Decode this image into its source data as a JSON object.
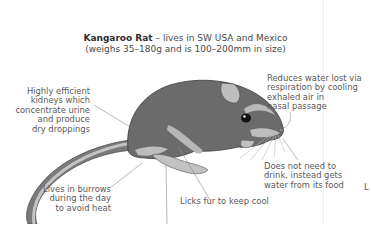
{
  "title": {
    "species": "Kangaroo Rat",
    "habitat": " – lives in SW USA and Mexico",
    "size_note": "(weighs 35–180g and is 100–200mm in size)"
  },
  "annotations": {
    "kidneys": "Highly efficient\nkidneys which\nconcentrate urine\nand produce\ndry droppings",
    "respiration": "Reduces water lost via\nrespiration by cooling\nexhaled air in\nnasal passage",
    "drinking": "Does not need to\ndrink, instead gets\nwater from its food",
    "burrows": "Lives in burrows\nduring the day\nto avoid heat",
    "licks_fur": "Licks fur to keep cool",
    "cutoff": "L"
  },
  "colors": {
    "body": "#6e6e6e",
    "light_fur": "#b9b9b9",
    "background": "#ffffff",
    "leader_line": "#8a8a8a"
  }
}
